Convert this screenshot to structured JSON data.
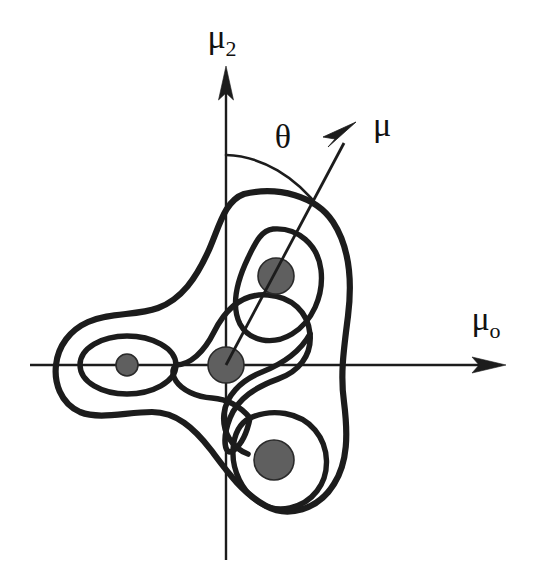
{
  "figure": {
    "background_color": "#ffffff",
    "stroke_color": "#1c1c1c",
    "blob_fill_color": "#5f5f5f"
  },
  "axes": {
    "vertical": {
      "label": "μ",
      "subscript": "2",
      "label_full": "μ2",
      "x": 226,
      "top_y": 66,
      "bottom_y": 560,
      "arrow_direction": "up"
    },
    "horizontal": {
      "label": "μ",
      "subscript": "o",
      "label_full": "μo",
      "y": 365,
      "left_x": 30,
      "right_x": 506,
      "arrow_direction": "right"
    },
    "origin": {
      "x": 226,
      "y": 365
    }
  },
  "vector": {
    "label": "μ",
    "origin": {
      "x": 226,
      "y": 365
    },
    "tip": {
      "x": 356,
      "y": 122
    },
    "arrow_direction": "up-right"
  },
  "angle": {
    "label": "θ",
    "description": "angle between the μ2 axis and the μ vector",
    "arc_start": {
      "x": 226,
      "y": 155
    },
    "arc_end": {
      "x": 322,
      "y": 211
    }
  },
  "modes": [
    {
      "name": "upper-right-mode",
      "cx": 276,
      "cy": 276,
      "r": 18
    },
    {
      "name": "center-mode",
      "cx": 226,
      "cy": 365,
      "r": 18
    },
    {
      "name": "left-mode",
      "cx": 127,
      "cy": 365,
      "r": 11
    },
    {
      "name": "lower-right-mode",
      "cx": 274,
      "cy": 460,
      "r": 20
    }
  ],
  "contours": {
    "outer_count": 1,
    "lobe_count": 3,
    "inner_petal_count": 3,
    "description": "A three-lobed outer contour encloses three inner lobe contours plus a central three-petal contour"
  },
  "labels": {
    "mu2_axis": "μ2",
    "mu0_axis": "μ0",
    "theta": "θ",
    "mu_vector": "μ"
  }
}
